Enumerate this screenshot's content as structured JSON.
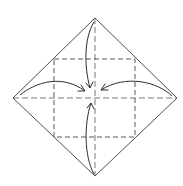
{
  "diagram": {
    "type": "origami-fold-diagram",
    "colors": {
      "background": "#ffffff",
      "line": "#3a3a3a",
      "dashed": "#444444"
    },
    "square": {
      "top": [
        95,
        18
      ],
      "right": [
        177,
        98
      ],
      "bottom": [
        95,
        176
      ],
      "left": [
        13,
        98
      ]
    },
    "center_creases": {
      "vertical": {
        "from": [
          95,
          18
        ],
        "to": [
          95,
          176
        ]
      },
      "horizontal": {
        "from": [
          13,
          98
        ],
        "to": [
          177,
          98
        ]
      }
    },
    "valley_fold_square": {
      "x1": 54,
      "y1": 59,
      "x2": 135,
      "y2": 137
    },
    "arrows": [
      {
        "name": "top-corner-arrow",
        "from": [
          94,
          22
        ],
        "to": [
          90,
          88
        ],
        "direction": "down"
      },
      {
        "name": "left-corner-arrow",
        "from": [
          20,
          95
        ],
        "to": [
          85,
          91
        ],
        "direction": "right"
      },
      {
        "name": "right-corner-arrow",
        "from": [
          172,
          96
        ],
        "to": [
          101,
          90
        ],
        "direction": "left"
      },
      {
        "name": "bottom-corner-arrow",
        "from": [
          94,
          174
        ],
        "to": [
          91,
          103
        ],
        "direction": "up"
      }
    ]
  }
}
